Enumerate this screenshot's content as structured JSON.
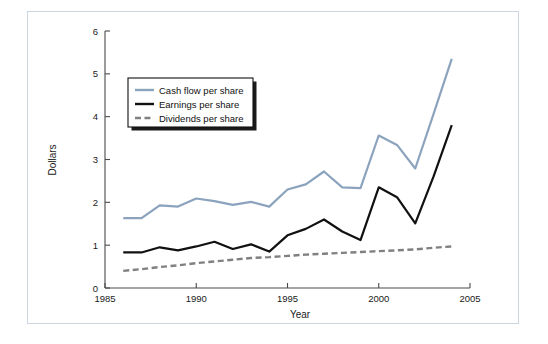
{
  "chart_data": {
    "type": "line",
    "title": "",
    "xlabel": "Year",
    "ylabel": "Dollars",
    "xlim": [
      1985,
      2005
    ],
    "ylim": [
      0,
      6
    ],
    "xticks": [
      1985,
      1990,
      1995,
      2000,
      2005
    ],
    "yticks": [
      0,
      1,
      2,
      3,
      4,
      5,
      6
    ],
    "grid": false,
    "legend_position": "upper-left-inside",
    "x": [
      1986,
      1987,
      1988,
      1989,
      1990,
      1991,
      1992,
      1993,
      1994,
      1995,
      1996,
      1997,
      1998,
      1999,
      2000,
      2001,
      2002,
      2003,
      2004
    ],
    "series": [
      {
        "name": "Cash flow per share",
        "color": "#8ba3bd",
        "style": "solid",
        "values": [
          1.63,
          1.63,
          1.93,
          1.9,
          2.09,
          2.03,
          1.94,
          2.01,
          1.9,
          2.3,
          2.42,
          2.72,
          2.35,
          2.33,
          3.56,
          3.34,
          2.79,
          4.06,
          5.35
        ]
      },
      {
        "name": "Earnings per share",
        "color": "#111111",
        "style": "solid",
        "values": [
          0.83,
          0.83,
          0.95,
          0.88,
          0.97,
          1.08,
          0.91,
          1.02,
          0.85,
          1.23,
          1.38,
          1.6,
          1.32,
          1.12,
          2.35,
          2.12,
          1.51,
          2.6,
          3.8
        ]
      },
      {
        "name": "Dividends per share",
        "color": "#808080",
        "style": "dashed",
        "values": [
          0.4,
          0.44,
          0.49,
          0.53,
          0.58,
          0.62,
          0.66,
          0.7,
          0.72,
          0.75,
          0.78,
          0.8,
          0.82,
          0.84,
          0.86,
          0.88,
          0.9,
          0.94,
          0.97
        ]
      }
    ]
  },
  "axes": {
    "x_tick_labels": [
      "1985",
      "1990",
      "1995",
      "2000",
      "2005"
    ],
    "y_tick_labels": [
      "0",
      "1",
      "2",
      "3",
      "4",
      "5",
      "6"
    ],
    "x_axis_title": "Year",
    "y_axis_title": "Dollars"
  },
  "legend": {
    "entries": [
      {
        "label": "Cash flow per share",
        "color": "#8ba3bd",
        "style": "solid"
      },
      {
        "label": "Earnings per share",
        "color": "#111111",
        "style": "solid"
      },
      {
        "label": "Dividends per share",
        "color": "#808080",
        "style": "dashed"
      }
    ]
  },
  "colors": {
    "cash_flow": "#8ba3bd",
    "earnings": "#111111",
    "dividends": "#808080",
    "frame_border": "#cbd6e0",
    "axis": "#4a4a4a",
    "background": "#ffffff"
  }
}
